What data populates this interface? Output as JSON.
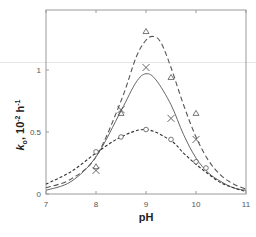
{
  "chart_data": {
    "type": "line",
    "title": "",
    "xlabel": "pH",
    "ylabel": "k_o, 10^-2 h^-1",
    "ylabel_parts": {
      "k": "k",
      "sub": "o",
      "rest": ", 10",
      "exp1": "-2",
      "unit": " h",
      "exp2": "-1"
    },
    "xlim": [
      7,
      11
    ],
    "ylim": [
      0,
      1.35
    ],
    "x_ticks": [
      7,
      8,
      9,
      10,
      11
    ],
    "x_tick_labels": [
      "7",
      "8",
      "9",
      "10",
      "11"
    ],
    "y_ticks": [
      0,
      0.5,
      1
    ],
    "y_tick_labels": [
      "0",
      "0.5",
      "1"
    ],
    "grid": false,
    "legend": null,
    "series": [
      {
        "name": "triangles (long-dashed fit)",
        "marker": "triangle",
        "line_style": "long-dash",
        "points": [
          [
            8.0,
            0.22
          ],
          [
            8.5,
            0.65
          ],
          [
            9.0,
            1.31
          ],
          [
            9.5,
            0.94
          ],
          [
            10.0,
            0.65
          ]
        ],
        "curve": [
          [
            7.0,
            0.05
          ],
          [
            7.5,
            0.12
          ],
          [
            8.0,
            0.3
          ],
          [
            8.5,
            0.75
          ],
          [
            8.8,
            1.1
          ],
          [
            9.0,
            1.24
          ],
          [
            9.15,
            1.27
          ],
          [
            9.3,
            1.22
          ],
          [
            9.5,
            1.02
          ],
          [
            9.75,
            0.72
          ],
          [
            10.0,
            0.46
          ],
          [
            10.25,
            0.27
          ],
          [
            10.5,
            0.15
          ],
          [
            10.75,
            0.08
          ],
          [
            11.0,
            0.04
          ]
        ]
      },
      {
        "name": "crosses (solid fit)",
        "marker": "cross",
        "line_style": "solid",
        "points": [
          [
            8.0,
            0.19
          ],
          [
            8.5,
            0.68
          ],
          [
            9.0,
            1.02
          ],
          [
            9.5,
            0.61
          ],
          [
            10.0,
            0.44
          ]
        ],
        "curve": [
          [
            7.0,
            0.03
          ],
          [
            7.5,
            0.1
          ],
          [
            8.0,
            0.3
          ],
          [
            8.5,
            0.67
          ],
          [
            8.8,
            0.9
          ],
          [
            9.0,
            0.97
          ],
          [
            9.2,
            0.92
          ],
          [
            9.5,
            0.72
          ],
          [
            9.75,
            0.48
          ],
          [
            10.0,
            0.29
          ],
          [
            10.25,
            0.17
          ],
          [
            10.5,
            0.1
          ],
          [
            10.75,
            0.05
          ],
          [
            11.0,
            0.03
          ]
        ]
      },
      {
        "name": "circles (short-dashed fit)",
        "marker": "circle",
        "line_style": "short-dash",
        "points": [
          [
            8.0,
            0.34
          ],
          [
            8.5,
            0.46
          ],
          [
            9.0,
            0.52
          ],
          [
            9.5,
            0.44
          ],
          [
            10.0,
            0.26
          ],
          [
            10.2,
            0.21
          ]
        ],
        "curve": [
          [
            7.0,
            0.08
          ],
          [
            7.5,
            0.18
          ],
          [
            8.0,
            0.33
          ],
          [
            8.5,
            0.46
          ],
          [
            9.0,
            0.52
          ],
          [
            9.5,
            0.43
          ],
          [
            9.75,
            0.33
          ],
          [
            10.0,
            0.24
          ],
          [
            10.25,
            0.16
          ],
          [
            10.5,
            0.09
          ],
          [
            10.75,
            0.05
          ],
          [
            11.0,
            0.02
          ]
        ]
      }
    ]
  },
  "colors": {
    "axis": "#9a9a9a",
    "triangle_line": "#555555",
    "cross_line": "#666666",
    "circle_line": "#333333",
    "marker": "#555555"
  }
}
